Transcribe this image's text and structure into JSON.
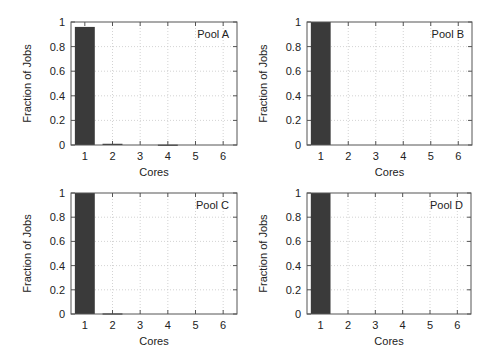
{
  "chart_data": [
    {
      "type": "bar",
      "panel": "Pool A",
      "title": "Pool A",
      "xlabel": "Cores",
      "ylabel": "Fraction of Jobs",
      "categories": [
        "1",
        "2",
        "3",
        "4",
        "5",
        "6"
      ],
      "values": [
        0.96,
        0.01,
        0.0,
        0.003,
        0.0,
        0.0
      ],
      "ylim": [
        0,
        1
      ],
      "yticks": [
        "0",
        "0.2",
        "0.4",
        "0.6",
        "0.8",
        "1"
      ],
      "grid": true,
      "legend_position": "top-right"
    },
    {
      "type": "bar",
      "panel": "Pool B",
      "title": "Pool B",
      "xlabel": "Cores",
      "ylabel": "Fraction of Jobs",
      "categories": [
        "1",
        "2",
        "3",
        "4",
        "5",
        "6"
      ],
      "values": [
        1.0,
        0.0,
        0.0,
        0.0,
        0.0,
        0.0
      ],
      "ylim": [
        0,
        1
      ],
      "yticks": [
        "0",
        "0.2",
        "0.4",
        "0.6",
        "0.8",
        "1"
      ],
      "grid": true,
      "legend_position": "top-right"
    },
    {
      "type": "bar",
      "panel": "Pool C",
      "title": "Pool C",
      "xlabel": "Cores",
      "ylabel": "Fraction of Jobs",
      "categories": [
        "1",
        "2",
        "3",
        "4",
        "5",
        "6"
      ],
      "values": [
        1.0,
        0.005,
        0.0,
        0.0,
        0.0,
        0.0
      ],
      "ylim": [
        0,
        1
      ],
      "yticks": [
        "0",
        "0.2",
        "0.4",
        "0.6",
        "0.8",
        "1"
      ],
      "grid": true,
      "legend_position": "top-right"
    },
    {
      "type": "bar",
      "panel": "Pool D",
      "title": "Pool D",
      "xlabel": "Cores",
      "ylabel": "Fraction of Jobs",
      "categories": [
        "1",
        "2",
        "3",
        "4",
        "5",
        "6"
      ],
      "values": [
        1.0,
        0.0,
        0.0,
        0.0,
        0.0,
        0.0
      ],
      "ylim": [
        0,
        1
      ],
      "yticks": [
        "0",
        "0.2",
        "0.4",
        "0.6",
        "0.8",
        "1"
      ],
      "grid": true,
      "legend_position": "top-right"
    }
  ],
  "style": {
    "bar_color": "#3a3a3a",
    "frame_color": "#555555",
    "grid_color": "#c8c8c8"
  },
  "layout": {
    "panels": [
      {
        "x0": 71,
        "y0": 22,
        "x1": 237,
        "y1": 145
      },
      {
        "x0": 307,
        "y0": 22,
        "x1": 472,
        "y1": 145
      },
      {
        "x0": 71,
        "y0": 193,
        "x1": 237,
        "y1": 314
      },
      {
        "x0": 307,
        "y0": 193,
        "x1": 471,
        "y1": 314
      }
    ]
  }
}
